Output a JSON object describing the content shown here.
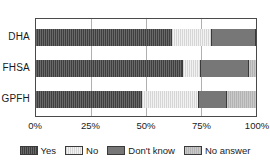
{
  "chart_data": {
    "type": "bar",
    "orientation": "horizontal",
    "stacked": true,
    "stack_mode": "percent",
    "title": "",
    "xlabel": "",
    "ylabel": "",
    "categories": [
      "DHA",
      "FHSA",
      "GPFH"
    ],
    "series": [
      {
        "name": "Yes",
        "values": [
          62,
          67,
          48
        ]
      },
      {
        "name": "No",
        "values": [
          18,
          8,
          26
        ]
      },
      {
        "name": "Don't know",
        "values": [
          20,
          22,
          13
        ]
      },
      {
        "name": "No answer",
        "values": [
          0,
          3,
          13
        ]
      }
    ],
    "xlim": [
      0,
      100
    ],
    "xticks": [
      0,
      25,
      50,
      75,
      100
    ],
    "xticklabels": [
      "0%",
      "25%",
      "50%",
      "75%",
      "100%"
    ],
    "grid": true,
    "grid_axis": "x",
    "legend_position": "bottom",
    "colors": {
      "Yes": "#3f3f3f",
      "No": "#f2f2f2",
      "Don't know": "#777777",
      "No answer": "#b3b3b3"
    }
  }
}
